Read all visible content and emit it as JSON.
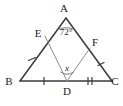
{
  "figure": {
    "background_color": "#ffffff",
    "stroke_color": "#3a3a3a",
    "cevian_color": "#8c8c8c",
    "label_color": "#1a1a1a"
  },
  "vertices": {
    "A": {
      "label": "A",
      "x": 66,
      "y": 18,
      "label_x": 64,
      "label_y": 12
    },
    "B": {
      "label": "B",
      "x": 20,
      "y": 81,
      "label_x": 9,
      "label_y": 85
    },
    "C": {
      "label": "C",
      "x": 112,
      "y": 81,
      "label_x": 114,
      "label_y": 85
    },
    "D": {
      "label": "D",
      "x": 67,
      "y": 81,
      "label_x": 67,
      "label_y": 95
    },
    "E": {
      "label": "E",
      "x": 45,
      "y": 36,
      "label_x": 38,
      "label_y": 34
    },
    "F": {
      "label": "F",
      "x": 90,
      "y": 48,
      "label_x": 94,
      "label_y": 46
    }
  },
  "angles": [
    {
      "name": "angle-at-A",
      "vertex": "A",
      "label": "72°",
      "value": 72,
      "unit": "degrees",
      "label_x": 66,
      "label_y": 33
    },
    {
      "name": "angle-at-D",
      "vertex": "D",
      "label": "x",
      "value": null,
      "unit": "unknown",
      "label_x": 67,
      "label_y": 70
    }
  ],
  "segments": [
    {
      "name": "side-AB",
      "from": "A",
      "to": "B",
      "style": "outer"
    },
    {
      "name": "side-AC",
      "from": "A",
      "to": "C",
      "style": "outer"
    },
    {
      "name": "side-BC",
      "from": "B",
      "to": "C",
      "style": "outer"
    },
    {
      "name": "cevian-ED",
      "from": "E",
      "to": "D",
      "style": "cevian"
    },
    {
      "name": "cevian-FD",
      "from": "F",
      "to": "D",
      "style": "cevian"
    }
  ],
  "tick_marks": [
    {
      "name": "tick-BE",
      "segment": "BE",
      "count": 1,
      "x": 32,
      "y": 59
    },
    {
      "name": "tick-FC",
      "segment": "FC",
      "count": 1,
      "x": 101,
      "y": 64
    },
    {
      "name": "tick-BD",
      "segment": "BD",
      "count": 1,
      "x": 44,
      "y": 81
    },
    {
      "name": "tick-DC",
      "segment": "DC",
      "count": 2,
      "x": 90,
      "y": 81
    }
  ]
}
